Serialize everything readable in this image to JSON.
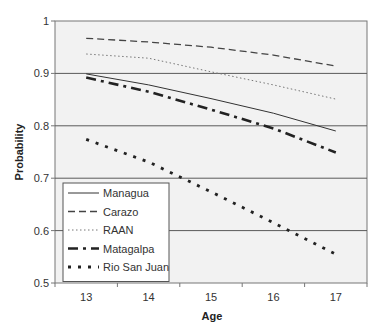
{
  "chart_data": {
    "type": "line",
    "title": "",
    "xlabel": "Age",
    "ylabel": "Probability",
    "categories": [
      "13",
      "14",
      "15",
      "16",
      "17"
    ],
    "ylim": [
      0.5,
      1
    ],
    "yticks": [
      "0.5",
      "0.6",
      "0.7",
      "0.8",
      "0.9",
      "1"
    ],
    "grid": "horizontal",
    "legend_position": "lower-left inside plot",
    "series": [
      {
        "name": "Managua",
        "values": [
          0.899,
          0.878,
          0.852,
          0.824,
          0.79
        ],
        "style": "solid",
        "color": "#333333",
        "width": 1
      },
      {
        "name": "Carazo",
        "values": [
          0.967,
          0.96,
          0.95,
          0.935,
          0.914
        ],
        "style": "dashed",
        "color": "#444444",
        "width": 1.3
      },
      {
        "name": "RAAN",
        "values": [
          0.937,
          0.929,
          0.903,
          0.878,
          0.851
        ],
        "style": "dotted",
        "color": "#777777",
        "width": 1
      },
      {
        "name": "Matagalpa",
        "values": [
          0.892,
          0.865,
          0.831,
          0.795,
          0.749
        ],
        "style": "dash-dot",
        "color": "#222222",
        "width": 2.6
      },
      {
        "name": "Rio San Juan",
        "values": [
          0.774,
          0.731,
          0.674,
          0.615,
          0.555
        ],
        "style": "dot-heavy",
        "color": "#222222",
        "width": 2.8
      }
    ]
  },
  "colors": {
    "plot_bg": "#f2f2f2",
    "grid": "#5a5a5a",
    "axis": "#777777"
  }
}
